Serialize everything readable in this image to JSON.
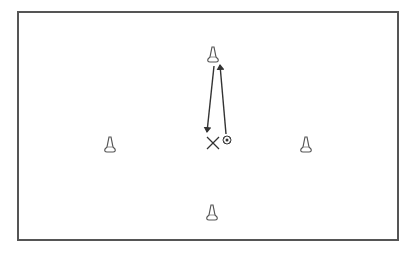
{
  "diagram": {
    "type": "soccer-drill",
    "background": "#ffffff",
    "field": {
      "x": 18,
      "y": 12,
      "width": 380,
      "height": 228,
      "stroke": "#555555",
      "stroke_width": 2
    },
    "cones": [
      {
        "id": "top",
        "x": 213,
        "y": 55
      },
      {
        "id": "left",
        "x": 110,
        "y": 145
      },
      {
        "id": "right",
        "x": 306,
        "y": 145
      },
      {
        "id": "bottom",
        "x": 212,
        "y": 213
      }
    ],
    "player": {
      "marker": "X",
      "x": 213,
      "y": 143,
      "size": 12,
      "color": "#333333"
    },
    "ball": {
      "x": 227,
      "y": 140,
      "r": 4
    },
    "arrows": [
      {
        "id": "run-down",
        "x1": 214,
        "y1": 66,
        "x2": 207,
        "y2": 132,
        "color": "#333333"
      },
      {
        "id": "pass-up",
        "x1": 226,
        "y1": 134,
        "x2": 220,
        "y2": 65,
        "color": "#333333"
      }
    ],
    "line_color": "#333333"
  }
}
